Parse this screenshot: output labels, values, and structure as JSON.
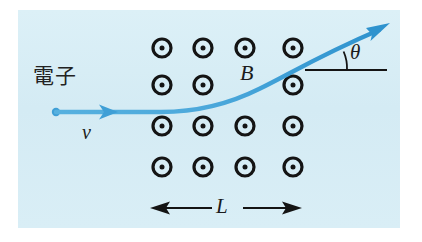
{
  "figure": {
    "name": "electron-deflection-in-magnetic-field",
    "panel": {
      "background_color": "#d6ecf4",
      "x": 18,
      "y": 10,
      "width": 382,
      "height": 218
    },
    "page_background_color": "#ffffff"
  },
  "labels": {
    "electron": "電子",
    "velocity": "v",
    "magnetic_field": "B",
    "angle": "θ",
    "length": "L"
  },
  "colors": {
    "trajectory_blue": "#3a9fd8",
    "trajectory_blue_light": "#6fc2e8",
    "ink_black": "#1b1b1b",
    "panel_blue": "#d6ecf4"
  },
  "field_symbols": {
    "glyph": "dot-in-circle",
    "meaning": "field-out-of-page",
    "rows": 4,
    "columns": 4,
    "column_x": [
      162,
      203,
      245,
      293
    ],
    "row_y": [
      48,
      85,
      126,
      167
    ],
    "outer_radius": 10.5,
    "ring_width": 3.2,
    "inner_dot_radius": 2.6
  },
  "trajectory": {
    "start_point": {
      "x": 56,
      "y": 112
    },
    "mid_arrow_x": 112,
    "end_point": {
      "x": 388,
      "y": 25
    },
    "path": "M56,112 L160,112 C196,112 228,104 258,90 C286,77 316,58 382,29",
    "stroke_width": 4.2
  },
  "reference_line": {
    "x1": 305,
    "x2": 386,
    "y": 70,
    "stroke_width": 2.2
  },
  "angle_arc": {
    "center_x": 305,
    "center_y": 70,
    "radius": 42,
    "start_deg": 0,
    "end_deg": 27
  },
  "dimension_line": {
    "x1": 152,
    "x2": 300,
    "y": 208,
    "label_gap_left": 212,
    "label_gap_right": 243,
    "stroke_width": 2.0
  }
}
